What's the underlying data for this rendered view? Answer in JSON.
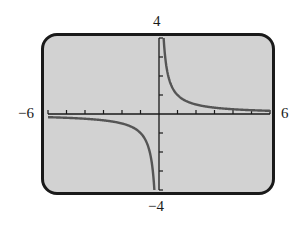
{
  "chart_data": {
    "type": "line",
    "title": "",
    "function": "y = 1/x",
    "xlabel": "",
    "ylabel": "",
    "xlim": [
      -6,
      6
    ],
    "ylim": [
      -4,
      4
    ],
    "xticks": [
      -6,
      -5,
      -4,
      -3,
      -2,
      -1,
      0,
      1,
      2,
      3,
      4,
      5,
      6
    ],
    "yticks": [
      -4,
      -3,
      -2,
      -1,
      0,
      1,
      2,
      3,
      4
    ],
    "grid": false,
    "series": [
      {
        "name": "y = 1/x (x < 0)",
        "x": [
          -6,
          -5,
          -4,
          -3,
          -2,
          -1,
          -0.5,
          -0.3,
          -0.25
        ],
        "y": [
          -0.167,
          -0.2,
          -0.25,
          -0.333,
          -0.5,
          -1,
          -2,
          -3.33,
          -4
        ]
      },
      {
        "name": "y = 1/x (x > 0)",
        "x": [
          0.25,
          0.3,
          0.5,
          1,
          2,
          3,
          4,
          5,
          6
        ],
        "y": [
          4,
          3.33,
          2,
          1,
          0.5,
          0.333,
          0.25,
          0.2,
          0.167
        ]
      }
    ],
    "colors": {
      "screen": "#d2d2d2",
      "frame": "#1a1a1a",
      "curve": "#555555",
      "axes": "#1a1a1a"
    }
  },
  "labels": {
    "xmin": "−6",
    "xmax": "6",
    "ymax": "4",
    "ymin": "−4"
  }
}
